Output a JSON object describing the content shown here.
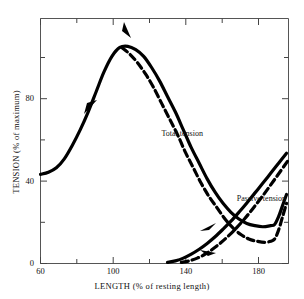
{
  "figure": {
    "kind": "scientific-figure",
    "background_color": "#ffffff",
    "ink_color": "#000000",
    "frame_color": "#555555"
  },
  "chart_data": {
    "type": "line",
    "title": "",
    "subtitle": "",
    "xlabel": "LENGTH (% of resting length)",
    "ylabel": "TENSION (% of maximum)",
    "xlim": [
      60,
      185
    ],
    "ylim": [
      0,
      110
    ],
    "grid": false,
    "legend_position": "inline-annotations",
    "x_ticks_major": [
      60,
      100,
      140,
      180
    ],
    "x_ticks_minor": [
      80,
      120,
      160
    ],
    "x_tick_labels": [
      "60",
      "100",
      "140",
      "180"
    ],
    "y_ticks_major": [
      0,
      40,
      80
    ],
    "y_ticks_minor": [
      20,
      60,
      100
    ],
    "y_tick_labels": [
      "0",
      "40",
      "80"
    ],
    "annotations": [
      {
        "text": "Total tension",
        "x": 124,
        "y": 58
      },
      {
        "text": "Passive tension",
        "x": 162,
        "y": 29
      }
    ],
    "series": [
      {
        "name": "Total tension (loading)",
        "style": "solid",
        "linewidth": 3.2,
        "arrow_direction": "rightward-ascending",
        "points": [
          [
            60,
            40
          ],
          [
            64,
            41
          ],
          [
            68,
            43
          ],
          [
            72,
            47
          ],
          [
            76,
            53
          ],
          [
            80,
            60
          ],
          [
            84,
            68
          ],
          [
            88,
            77
          ],
          [
            92,
            86
          ],
          [
            96,
            93
          ],
          [
            100,
            97
          ],
          [
            104,
            97.5
          ],
          [
            108,
            96
          ],
          [
            112,
            93
          ],
          [
            116,
            88
          ],
          [
            120,
            82
          ],
          [
            124,
            75
          ],
          [
            128,
            68
          ],
          [
            132,
            60
          ],
          [
            136,
            52
          ],
          [
            140,
            45
          ],
          [
            144,
            38
          ],
          [
            148,
            32
          ],
          [
            152,
            27
          ],
          [
            156,
            23
          ],
          [
            160,
            20
          ],
          [
            164,
            18
          ],
          [
            168,
            17
          ],
          [
            172,
            16.5
          ],
          [
            176,
            17
          ],
          [
            178,
            17.5
          ],
          [
            180,
            21
          ],
          [
            182,
            26
          ],
          [
            184,
            31
          ]
        ]
      },
      {
        "name": "Total tension (unloading)",
        "style": "dashed",
        "linewidth": 3.2,
        "arrow_direction": "leftward-descending",
        "points": [
          [
            101,
            97
          ],
          [
            105,
            94
          ],
          [
            109,
            90
          ],
          [
            113,
            85
          ],
          [
            117,
            79
          ],
          [
            121,
            72
          ],
          [
            125,
            65
          ],
          [
            129,
            58
          ],
          [
            133,
            50
          ],
          [
            137,
            43
          ],
          [
            141,
            36
          ],
          [
            145,
            30
          ],
          [
            149,
            25
          ],
          [
            153,
            20
          ],
          [
            157,
            16
          ],
          [
            161,
            13
          ],
          [
            165,
            11
          ],
          [
            169,
            10
          ],
          [
            173,
            9.5
          ],
          [
            176,
            10
          ],
          [
            178,
            11
          ],
          [
            180,
            15
          ],
          [
            182,
            21
          ],
          [
            184,
            27
          ]
        ]
      },
      {
        "name": "Passive tension (loading)",
        "style": "solid",
        "linewidth": 3.2,
        "arrow_direction": "rightward-ascending",
        "points": [
          [
            124,
            0.5
          ],
          [
            128,
            1.2
          ],
          [
            132,
            2.4
          ],
          [
            136,
            4.2
          ],
          [
            140,
            6.4
          ],
          [
            144,
            9.0
          ],
          [
            148,
            12.0
          ],
          [
            152,
            15.4
          ],
          [
            156,
            19.0
          ],
          [
            160,
            23.0
          ],
          [
            164,
            27.2
          ],
          [
            168,
            31.6
          ],
          [
            172,
            36.0
          ],
          [
            176,
            40.5
          ],
          [
            180,
            45.0
          ],
          [
            184,
            49.5
          ]
        ]
      },
      {
        "name": "Passive tension (unloading)",
        "style": "dashed",
        "linewidth": 3.2,
        "arrow_direction": "leftward-descending",
        "points": [
          [
            131,
            0.5
          ],
          [
            135,
            1.2
          ],
          [
            139,
            2.4
          ],
          [
            143,
            4.2
          ],
          [
            147,
            6.6
          ],
          [
            151,
            9.4
          ],
          [
            155,
            12.6
          ],
          [
            159,
            16.2
          ],
          [
            163,
            20.2
          ],
          [
            167,
            24.6
          ],
          [
            171,
            29.2
          ],
          [
            175,
            34.0
          ],
          [
            179,
            39.0
          ],
          [
            183,
            44.0
          ],
          [
            185,
            46.5
          ]
        ]
      }
    ]
  }
}
